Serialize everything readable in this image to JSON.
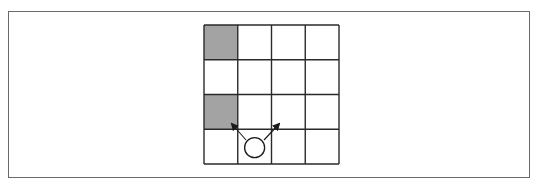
{
  "diagram": {
    "type": "grid-world",
    "rows": 4,
    "cols": 4,
    "grid_origin": [
      204,
      25
    ],
    "cell_size": [
      33.75,
      34.75
    ],
    "colors": {
      "frame": "#6a6a6a",
      "grid_line": "#2a2a2a",
      "shaded": "#a3a3a3",
      "empty": "#ffffff",
      "agent": "#1a1a1a"
    },
    "shaded_cells": [
      {
        "row": 0,
        "col": 0
      },
      {
        "row": 2,
        "col": 0
      }
    ],
    "agent": {
      "row": 3,
      "col": 1,
      "shape": "circle"
    },
    "arrows": [
      {
        "name": "up-left",
        "from": [
          246,
          140
        ],
        "to": [
          232,
          124
        ]
      },
      {
        "name": "up-right",
        "from": [
          264,
          140
        ],
        "to": [
          279,
          124
        ]
      }
    ]
  }
}
